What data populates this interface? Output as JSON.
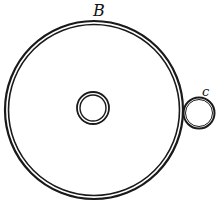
{
  "diagram": {
    "labels": {
      "outer": "B",
      "small": "c"
    },
    "colors": {
      "stroke": "#1a1a1a",
      "background": "#ffffff"
    },
    "shapes": {
      "outer_ring": {
        "cx": 94,
        "cy": 110,
        "r_outer": 89,
        "r_inner": 85
      },
      "center_ring": {
        "cx": 93,
        "cy": 108,
        "r_outer": 16,
        "r_inner": 13
      },
      "small_ring": {
        "cx": 199,
        "cy": 113,
        "r": 15
      }
    }
  }
}
